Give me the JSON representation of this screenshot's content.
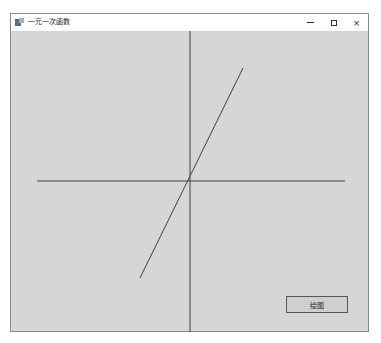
{
  "window": {
    "title": "一元一次函数",
    "controls": {
      "minimize": "minimize",
      "maximize": "maximize",
      "close": "×"
    }
  },
  "canvas": {
    "background": "#d6d6d6",
    "axis_color": "#404040",
    "line_color": "#404040",
    "x_axis": {
      "x1": 26,
      "y1": 150,
      "x2": 334,
      "y2": 150
    },
    "y_axis": {
      "x1": 179,
      "y1": 0,
      "x2": 179,
      "y2": 302
    },
    "function_line": {
      "x1": 129,
      "y1": 247,
      "x2": 232,
      "y2": 37
    }
  },
  "buttons": {
    "draw_label": "绘图"
  }
}
